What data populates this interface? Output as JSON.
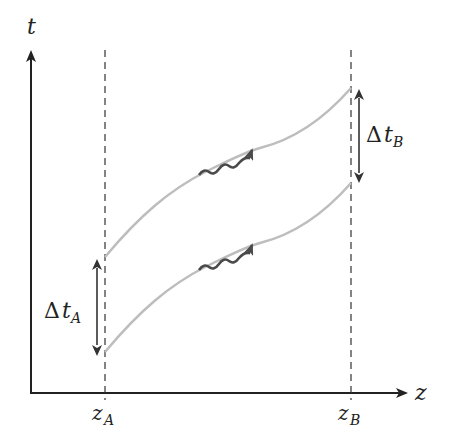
{
  "diagram": {
    "axes": {
      "y_label": "t",
      "x_label": "z"
    },
    "positions": {
      "z_A": {
        "symbol": "z",
        "subscript": "A"
      },
      "z_B": {
        "symbol": "z",
        "subscript": "B"
      }
    },
    "intervals": {
      "delta_t_A": {
        "delta": "Δ",
        "symbol": "t",
        "subscript": "A"
      },
      "delta_t_B": {
        "delta": "Δ",
        "symbol": "t",
        "subscript": "B"
      }
    },
    "worldlines": [
      {
        "name": "upper-worldline",
        "label": ""
      },
      {
        "name": "lower-worldline",
        "label": ""
      }
    ],
    "photons": [
      {
        "name": "upper-photon"
      },
      {
        "name": "lower-photon"
      }
    ],
    "colors": {
      "axis": "#222222",
      "worldline": "#bdbdbd",
      "photon": "#555555",
      "dashed": "#333333"
    }
  }
}
